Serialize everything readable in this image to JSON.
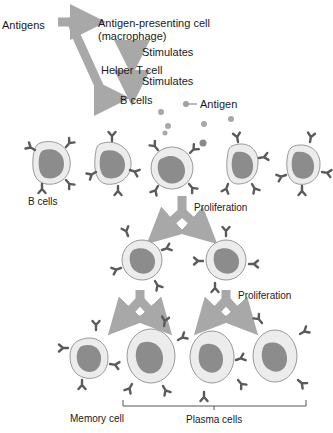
{
  "colors": {
    "arrow": "#a8a8a8",
    "cell_outer": "#e8e8e8",
    "cell_outline": "#9a9a9a",
    "nucleus": "#8c8c8c",
    "receptor": "#5a5a5a",
    "antigen": "#a0a0a0",
    "text": "#1a1a1a"
  },
  "labels": {
    "antigens": "Antigens",
    "apc_line1": "Antigen-presenting cell",
    "apc_line2": "(macrophage)",
    "stimulates_1": "Stimulates",
    "helper_t": "Helper T cell",
    "stimulates_2": "Stimulates",
    "b_cells_top": "B cells",
    "antigen_legend": "Antigen",
    "b_cells_row": "B cells",
    "proliferation_1": "Proliferation",
    "proliferation_2": "Proliferation",
    "memory_cell": "Memory cell",
    "plasma_cells": "Plasma cells"
  },
  "rows": [
    {
      "name": "b-cell-row",
      "count": 5,
      "note": "center cell binds antigen"
    },
    {
      "name": "daughter-row",
      "count": 2
    },
    {
      "name": "final-row",
      "count": 4,
      "types": [
        "memory",
        "plasma",
        "plasma",
        "plasma"
      ]
    }
  ]
}
